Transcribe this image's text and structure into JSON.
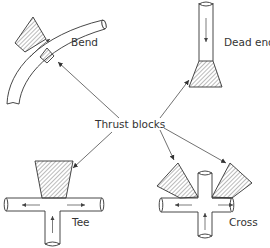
{
  "diagram": {
    "center_label": "Thrust blocks",
    "colors": {
      "ink": "#333333",
      "hatch": "#555555",
      "background": "#ffffff"
    },
    "fittings": [
      {
        "id": "bend",
        "label": "Bend"
      },
      {
        "id": "dead-end",
        "label": "Dead end"
      },
      {
        "id": "tee",
        "label": "Tee"
      },
      {
        "id": "cross",
        "label": "Cross"
      }
    ]
  }
}
